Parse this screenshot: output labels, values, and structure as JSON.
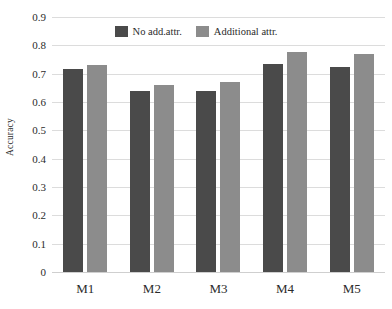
{
  "chart_data": {
    "type": "bar",
    "title": "",
    "subtitle": "",
    "xlabel": "",
    "ylabel": "Accuracy",
    "categories": [
      "M1",
      "M2",
      "M3",
      "M4",
      "M5"
    ],
    "series": [
      {
        "name": "No add.attr.",
        "color": "#4a4a4a",
        "values": [
          0.715,
          0.64,
          0.64,
          0.735,
          0.725
        ]
      },
      {
        "name": "Additional attr.",
        "color": "#8c8c8c",
        "values": [
          0.73,
          0.66,
          0.67,
          0.775,
          0.77
        ]
      }
    ],
    "ylim": [
      0,
      0.9
    ],
    "ytick_labels": [
      "0.9",
      "0.8",
      "0.7",
      "0.6",
      "0.5",
      "0.4",
      "0.3",
      "0.2",
      "0.1",
      "0"
    ],
    "ytick_values": [
      0.9,
      0.8,
      0.7,
      0.6,
      0.5,
      0.4,
      0.3,
      0.2,
      0.1,
      0
    ],
    "grid": true,
    "grid_axis": "y",
    "grid_color": "#dcdcdc",
    "legend_position": "top-center",
    "background_color": "#ffffff"
  }
}
